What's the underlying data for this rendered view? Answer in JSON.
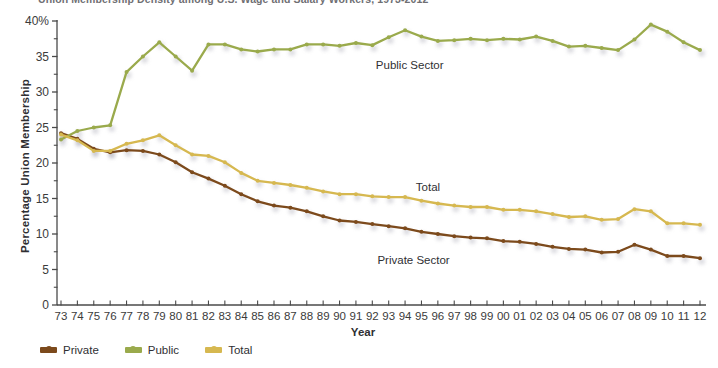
{
  "title": "Union Membership Density among U.S. Wage and Salary Workers, 1973-2012",
  "axes": {
    "y_title": "Percentage Union Membership",
    "x_title": "Year",
    "y_ticks": [
      "40%",
      "35",
      "30",
      "25",
      "20",
      "15",
      "10",
      "5",
      "0"
    ],
    "x_ticks": [
      "73",
      "74",
      "75",
      "76",
      "77",
      "78",
      "79",
      "80",
      "81",
      "82",
      "83",
      "84",
      "85",
      "86",
      "87",
      "88",
      "89",
      "90",
      "91",
      "92",
      "93",
      "94",
      "95",
      "96",
      "97",
      "98",
      "99",
      "00",
      "01",
      "02",
      "03",
      "04",
      "05",
      "06",
      "07",
      "08",
      "09",
      "10",
      "11",
      "12"
    ]
  },
  "annotations": {
    "public": "Public Sector",
    "total": "Total",
    "private": "Private Sector"
  },
  "legend": {
    "items": [
      {
        "label": "Private",
        "color": "#7c4a1c"
      },
      {
        "label": "Public",
        "color": "#9aaa4c"
      },
      {
        "label": "Total",
        "color": "#d6b850"
      }
    ]
  },
  "colors": {
    "private": "#7c4a1c",
    "public": "#9aaa4c",
    "total": "#d6b850",
    "axis": "#4a4a4a",
    "marker_shadow": "#9a9aa8"
  },
  "chart_data": {
    "type": "line",
    "title": "Union Membership Density among U.S. Wage and Salary Workers, 1973-2012",
    "xlabel": "Year",
    "ylabel": "Percentage Union Membership",
    "ylim": [
      0,
      40
    ],
    "ytick_step": 5,
    "yminor_step": 2.5,
    "grid": false,
    "legend_position": "bottom-left",
    "x": [
      1973,
      1974,
      1975,
      1976,
      1977,
      1978,
      1979,
      1980,
      1981,
      1982,
      1983,
      1984,
      1985,
      1986,
      1987,
      1988,
      1989,
      1990,
      1991,
      1992,
      1993,
      1994,
      1995,
      1996,
      1997,
      1998,
      1999,
      2000,
      2001,
      2002,
      2003,
      2004,
      2005,
      2006,
      2007,
      2008,
      2009,
      2010,
      2011,
      2012
    ],
    "categories": [
      "73",
      "74",
      "75",
      "76",
      "77",
      "78",
      "79",
      "80",
      "81",
      "82",
      "83",
      "84",
      "85",
      "86",
      "87",
      "88",
      "89",
      "90",
      "91",
      "92",
      "93",
      "94",
      "95",
      "96",
      "97",
      "98",
      "99",
      "00",
      "01",
      "02",
      "03",
      "04",
      "05",
      "06",
      "07",
      "08",
      "09",
      "10",
      "11",
      "12"
    ],
    "series": [
      {
        "name": "Private Sector",
        "color": "#7c4a1c",
        "values": [
          24.2,
          23.4,
          22.0,
          21.5,
          21.8,
          21.7,
          21.2,
          20.1,
          18.7,
          17.8,
          16.8,
          15.6,
          14.6,
          14.0,
          13.7,
          13.2,
          12.5,
          11.9,
          11.7,
          11.4,
          11.1,
          10.8,
          10.3,
          10.0,
          9.7,
          9.5,
          9.4,
          9.0,
          8.9,
          8.6,
          8.2,
          7.9,
          7.8,
          7.4,
          7.5,
          8.5,
          7.8,
          6.9,
          6.9,
          6.6
        ]
      },
      {
        "name": "Public Sector",
        "color": "#9aaa4c",
        "values": [
          23.3,
          24.5,
          25.0,
          25.3,
          32.8,
          35.0,
          37.0,
          35.0,
          33.0,
          36.7,
          36.7,
          36.0,
          35.7,
          36.0,
          36.0,
          36.7,
          36.7,
          36.5,
          36.9,
          36.6,
          37.7,
          38.7,
          37.8,
          37.2,
          37.3,
          37.5,
          37.3,
          37.5,
          37.4,
          37.8,
          37.2,
          36.4,
          36.5,
          36.2,
          35.9,
          37.4,
          39.5,
          38.5,
          37.0,
          35.9
        ]
      },
      {
        "name": "Total",
        "color": "#d6b850",
        "values": [
          24.0,
          23.2,
          21.7,
          21.7,
          22.7,
          23.2,
          23.9,
          22.5,
          21.2,
          21.0,
          20.1,
          18.6,
          17.5,
          17.2,
          16.9,
          16.5,
          16.0,
          15.6,
          15.6,
          15.3,
          15.2,
          15.2,
          14.7,
          14.3,
          14.0,
          13.8,
          13.8,
          13.4,
          13.4,
          13.2,
          12.8,
          12.4,
          12.5,
          12.0,
          12.1,
          13.5,
          13.2,
          11.5,
          11.5,
          11.3
        ]
      }
    ]
  }
}
